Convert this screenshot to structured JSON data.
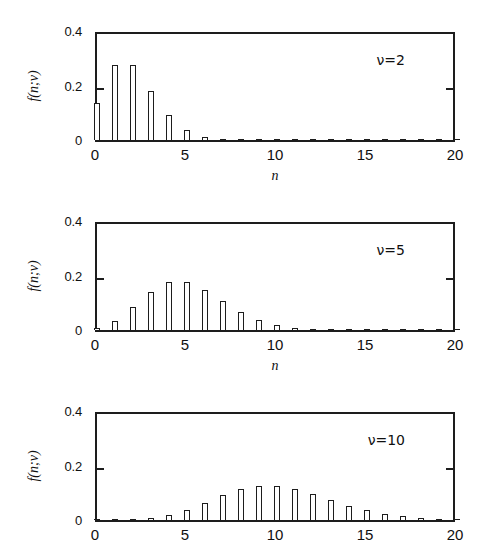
{
  "figure": {
    "background": "#ffffff",
    "ink_color": "#1d1d1d",
    "axis_title_x": "n",
    "axis_title_y": "f(n;ν)"
  },
  "panels": [
    {
      "id": "panel-nu-2",
      "annotation": "ν=2",
      "y_ticks": [
        "0",
        "0.2",
        "0.4"
      ],
      "x_ticks": [
        "0",
        "5",
        "10",
        "15",
        "20"
      ],
      "axis_title_x": "n",
      "axis_title_y": "f(n;ν)"
    },
    {
      "id": "panel-nu-5",
      "annotation": "ν=5",
      "y_ticks": [
        "0",
        "0.2",
        "0.4"
      ],
      "x_ticks": [
        "0",
        "5",
        "10",
        "15",
        "20"
      ],
      "axis_title_x": "n",
      "axis_title_y": "f(n;ν)"
    },
    {
      "id": "panel-nu-10",
      "annotation": "ν=10",
      "y_ticks": [
        "0",
        "0.2",
        "0.4"
      ],
      "x_ticks": [
        "0",
        "5",
        "10",
        "15",
        "20"
      ],
      "axis_title_x": "n",
      "axis_title_y": "f(n;ν)"
    }
  ],
  "chart_data": [
    {
      "type": "bar",
      "title": "",
      "subtitle": "",
      "annotation": "ν=2",
      "xlabel": "n",
      "ylabel": "f(n;ν)",
      "xlim": [
        0,
        20
      ],
      "ylim": [
        0,
        0.4
      ],
      "xticks": [
        0,
        5,
        10,
        15,
        20
      ],
      "yticks": [
        0,
        0.2,
        0.4
      ],
      "grid": false,
      "legend": false,
      "categories": [
        0,
        1,
        2,
        3,
        4,
        5,
        6,
        7,
        8,
        9,
        10,
        11,
        12,
        13,
        14,
        15,
        16,
        17,
        18,
        19,
        20
      ],
      "values": [
        0.135,
        0.271,
        0.271,
        0.18,
        0.09,
        0.036,
        0.012,
        0.003,
        0.001,
        0.0,
        0.0,
        0.0,
        0.0,
        0.0,
        0.0,
        0.0,
        0.0,
        0.0,
        0.0,
        0.0,
        0.0
      ]
    },
    {
      "type": "bar",
      "title": "",
      "subtitle": "",
      "annotation": "ν=5",
      "xlabel": "n",
      "ylabel": "f(n;ν)",
      "xlim": [
        0,
        20
      ],
      "ylim": [
        0,
        0.4
      ],
      "xticks": [
        0,
        5,
        10,
        15,
        20
      ],
      "yticks": [
        0,
        0.2,
        0.4
      ],
      "grid": false,
      "legend": false,
      "categories": [
        0,
        1,
        2,
        3,
        4,
        5,
        6,
        7,
        8,
        9,
        10,
        11,
        12,
        13,
        14,
        15,
        16,
        17,
        18,
        19,
        20
      ],
      "values": [
        0.007,
        0.034,
        0.084,
        0.14,
        0.175,
        0.175,
        0.146,
        0.104,
        0.065,
        0.036,
        0.018,
        0.008,
        0.003,
        0.001,
        0.0,
        0.0,
        0.0,
        0.0,
        0.0,
        0.0,
        0.0
      ]
    },
    {
      "type": "bar",
      "title": "",
      "subtitle": "",
      "annotation": "ν=10",
      "xlabel": "n",
      "ylabel": "f(n;ν)",
      "xlim": [
        0,
        20
      ],
      "ylim": [
        0,
        0.4
      ],
      "xticks": [
        0,
        5,
        10,
        15,
        20
      ],
      "yticks": [
        0,
        0.2,
        0.4
      ],
      "grid": false,
      "legend": false,
      "categories": [
        0,
        1,
        2,
        3,
        4,
        5,
        6,
        7,
        8,
        9,
        10,
        11,
        12,
        13,
        14,
        15,
        16,
        17,
        18,
        19,
        20
      ],
      "values": [
        0.0,
        0.0,
        0.002,
        0.008,
        0.019,
        0.038,
        0.063,
        0.09,
        0.113,
        0.125,
        0.125,
        0.114,
        0.095,
        0.073,
        0.052,
        0.035,
        0.022,
        0.013,
        0.007,
        0.004,
        0.002
      ]
    }
  ]
}
